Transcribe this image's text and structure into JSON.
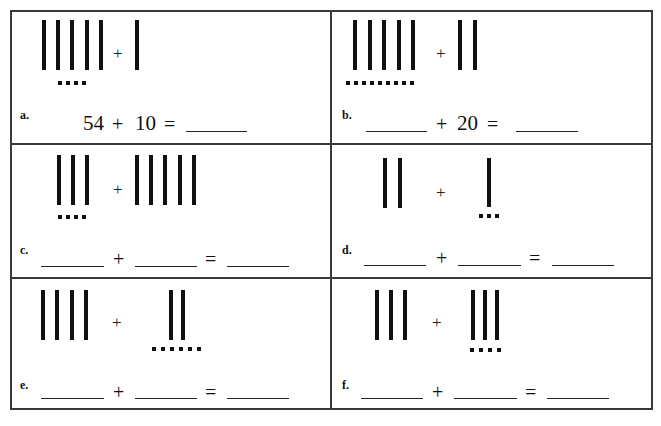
{
  "worksheet": {
    "problems": [
      {
        "label": "a.",
        "tally_left": {
          "tens": 5,
          "ones": 4
        },
        "tally_right": {
          "tens": 1,
          "ones": 0
        },
        "equation": {
          "addend1": "54",
          "plus": "+",
          "addend2": "10",
          "equals": "=",
          "sum": ""
        }
      },
      {
        "label": "b.",
        "tally_left": {
          "tens": 5,
          "ones": 9
        },
        "tally_right": {
          "tens": 2,
          "ones": 0
        },
        "equation": {
          "addend1": "",
          "plus": "+",
          "addend2": "20",
          "equals": "=",
          "sum": ""
        }
      },
      {
        "label": "c.",
        "tally_left": {
          "tens": 3,
          "ones": 4
        },
        "tally_right": {
          "tens": 5,
          "ones": 0
        },
        "equation": {
          "addend1": "",
          "plus": "+",
          "addend2": "",
          "equals": "=",
          "sum": ""
        }
      },
      {
        "label": "d.",
        "tally_left": {
          "tens": 2,
          "ones": 0
        },
        "tally_right": {
          "tens": 1,
          "ones": 3
        },
        "equation": {
          "addend1": "",
          "plus": "+",
          "addend2": "",
          "equals": "=",
          "sum": ""
        }
      },
      {
        "label": "e.",
        "tally_left": {
          "tens": 4,
          "ones": 0
        },
        "tally_right": {
          "tens": 2,
          "ones": 6
        },
        "equation": {
          "addend1": "",
          "plus": "+",
          "addend2": "",
          "equals": "=",
          "sum": ""
        }
      },
      {
        "label": "f.",
        "tally_left": {
          "tens": 3,
          "ones": 0
        },
        "tally_right": {
          "tens": 3,
          "ones": 4
        },
        "equation": {
          "addend1": "",
          "plus": "+",
          "addend2": "",
          "equals": "=",
          "sum": ""
        }
      }
    ],
    "tally_plus": "+"
  }
}
